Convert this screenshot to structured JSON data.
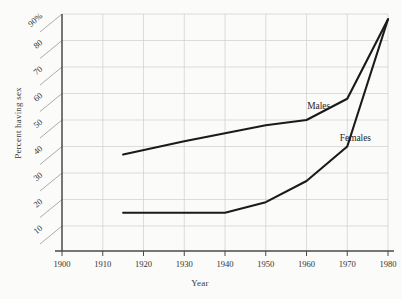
{
  "chart_data": {
    "type": "line",
    "title": "",
    "xlabel": "Year",
    "ylabel": "Percent having sex",
    "xlim": [
      1900,
      1980
    ],
    "ylim": [
      0,
      90
    ],
    "grid": true,
    "legend_position": "inline-labels",
    "x_ticks": [
      "1900",
      "1910",
      "1920",
      "1930",
      "1940",
      "1950",
      "1960",
      "1970",
      "1980"
    ],
    "y_ticks": [
      "10",
      "20",
      "30",
      "40",
      "50",
      "60",
      "70",
      "80",
      "90%"
    ],
    "y_tick_values": [
      10,
      20,
      30,
      40,
      50,
      60,
      70,
      80,
      90
    ],
    "x_tick_values": [
      1900,
      1910,
      1920,
      1930,
      1940,
      1950,
      1960,
      1970,
      1980
    ],
    "series": [
      {
        "name": "Males",
        "label": "Males",
        "color": "#1a1a1a",
        "x": [
          1915,
          1930,
          1940,
          1950,
          1960,
          1970,
          1980
        ],
        "values": [
          37,
          42,
          45,
          48,
          50,
          58,
          88
        ]
      },
      {
        "name": "Females",
        "label": "Females",
        "color": "#1a1a1a",
        "x": [
          1915,
          1930,
          1940,
          1950,
          1960,
          1970,
          1980
        ],
        "values": [
          15,
          15,
          15,
          19,
          27,
          40,
          88
        ]
      }
    ],
    "annotations": [
      {
        "text": "Males",
        "x": 1963,
        "y": 54
      },
      {
        "text": "Females",
        "x": 1972,
        "y": 42
      }
    ]
  },
  "axis_titles": {
    "x": "Year",
    "y": "Percent having sex"
  },
  "colors": {
    "background": "#fbfbf9",
    "line": "#1a1a1a",
    "grid": "#cfcfcf",
    "axis": "#4a4a4a",
    "text": "#2b2b2b"
  }
}
